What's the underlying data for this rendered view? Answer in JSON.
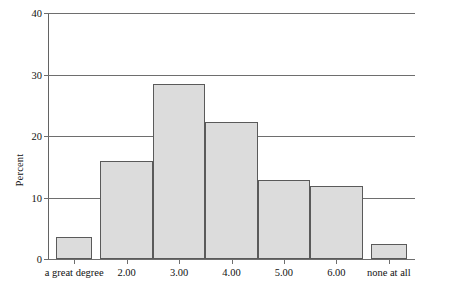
{
  "chart_data": {
    "type": "bar",
    "title": "",
    "subtitle": "",
    "xlabel": "",
    "ylabel": "Percent",
    "categories": [
      "a great degree",
      "2.00",
      "3.00",
      "4.00",
      "5.00",
      "6.00",
      "none at all"
    ],
    "values": [
      3.6,
      15.9,
      28.4,
      22.3,
      12.9,
      11.8,
      2.4
    ],
    "ylim": [
      0,
      40
    ],
    "yticks": [
      0,
      10,
      20,
      30,
      40
    ],
    "ytick_labels": [
      "0",
      "10",
      "20",
      "30",
      "40"
    ],
    "grid": true,
    "grid_axis": "y",
    "legend": false,
    "legend_position": "none",
    "bar_fill_color": "#dcdcdc",
    "bar_border_color": "#5a5a5a",
    "axis_color": "#6e6e6e",
    "background_color": "#ffffff"
  },
  "axes": {
    "y_title": "Percent"
  }
}
